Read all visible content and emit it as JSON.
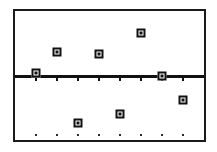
{
  "chart_data": {
    "type": "scatter",
    "title": "",
    "subtitle": "",
    "xlabel": "",
    "ylabel": "",
    "xlim": [
      0,
      9
    ],
    "ylim": [
      -1.0,
      1.0
    ],
    "grid": false,
    "legend": null,
    "axis_line_y": 0,
    "x": [
      1,
      2,
      3,
      4,
      5,
      6,
      7,
      8
    ],
    "series": [
      {
        "name": "residuals",
        "marker": "square",
        "values": [
          0.04,
          0.36,
          -0.73,
          0.33,
          -0.6,
          0.66,
          0.0,
          -0.38
        ]
      }
    ],
    "points": [
      {
        "label": "p1",
        "x": 1,
        "y": 0.04
      },
      {
        "label": "p2",
        "x": 2,
        "y": 0.36
      },
      {
        "label": "p3",
        "x": 3,
        "y": -0.73
      },
      {
        "label": "p4",
        "x": 4,
        "y": 0.33
      },
      {
        "label": "p5",
        "x": 5,
        "y": -0.6
      },
      {
        "label": "p6",
        "x": 6,
        "y": 0.66
      },
      {
        "label": "p7",
        "x": 7,
        "y": 0.0
      },
      {
        "label": "p8",
        "x": 8,
        "y": -0.38
      }
    ],
    "xtick_values": [
      1,
      2,
      3,
      4,
      5,
      6,
      7,
      8
    ],
    "xtick_labels": [
      "",
      "",
      "",
      "",
      "",
      "",
      "",
      ""
    ],
    "ytick_values": [],
    "ytick_labels": [],
    "baseline_dot_x": [
      1,
      2,
      3,
      4,
      5,
      6,
      7,
      8
    ],
    "baseline_dot_y": -0.93,
    "colors": {
      "frame": "#1a1a1a",
      "axis": "#111111",
      "marker_edge": "#111111",
      "marker_face": "#ffffff",
      "dot": "#2a2a2a",
      "background": "#ffffff"
    },
    "description": "Scatter plot of eight square markers distributed above and below a thick horizontal baseline, with tick marks on the baseline and a row of small dots near the bottom of the frame."
  }
}
